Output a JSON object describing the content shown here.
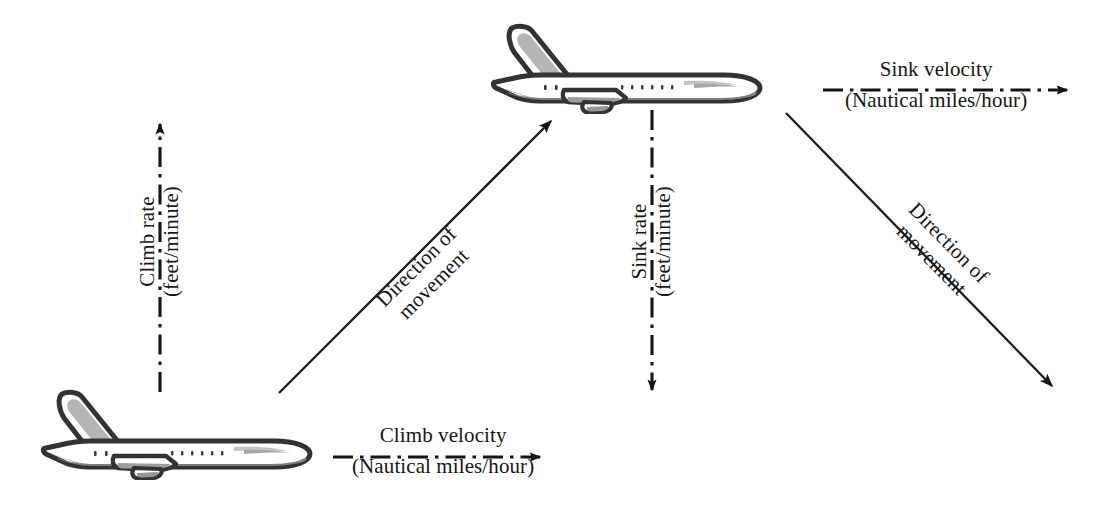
{
  "diagram": {
    "background_color": "#ffffff",
    "line_color": "#1a1a1a",
    "aircraft_fill": "#ffffff",
    "aircraft_shade": "#9a9a9a",
    "aircraft_outline": "#2b2b2b"
  },
  "labels": {
    "climb_rate": {
      "line1": "Climb rate",
      "line2": "(feet/minute)"
    },
    "sink_rate": {
      "line1": "Sink rate",
      "line2": "(feet/minute)"
    },
    "climb_velocity": {
      "line1": "Climb velocity",
      "line2": "(Nautical miles/hour)"
    },
    "sink_velocity": {
      "line1": "Sink velocity",
      "line2": "(Nautical miles/hour)"
    },
    "direction_climb": {
      "line1": "Direction of",
      "line2": "movement"
    },
    "direction_descent": {
      "line1": "Direction of",
      "line2": "movement"
    }
  },
  "arrows": [
    {
      "name": "climb-rate-arrow",
      "style": "dash-dot",
      "orientation": "vertical-up",
      "from": [
        160,
        392
      ],
      "to": [
        160,
        118
      ]
    },
    {
      "name": "sink-rate-arrow",
      "style": "dash-dot",
      "orientation": "vertical-down",
      "from": [
        652,
        110
      ],
      "to": [
        652,
        396
      ]
    },
    {
      "name": "climb-velocity-arrow",
      "style": "dash-dot",
      "orientation": "horizontal-right",
      "from": [
        333,
        457
      ],
      "to": [
        546,
        457
      ]
    },
    {
      "name": "sink-velocity-arrow",
      "style": "dash-dot",
      "orientation": "horizontal-right",
      "from": [
        823,
        90
      ],
      "to": [
        1073,
        90
      ]
    },
    {
      "name": "direction-of-movement-climb-arrow",
      "style": "solid",
      "orientation": "diagonal-up-right",
      "from": [
        279,
        393
      ],
      "to": [
        556,
        116
      ]
    },
    {
      "name": "direction-of-movement-descent-arrow",
      "style": "solid",
      "orientation": "diagonal-down-right",
      "from": [
        786,
        113
      ],
      "to": [
        1057,
        391
      ]
    }
  ],
  "aircraft": [
    {
      "name": "aircraft-lower-left",
      "position": [
        38,
        388
      ],
      "width": 278,
      "height": 92,
      "heading": "right"
    },
    {
      "name": "aircraft-upper-middle",
      "position": [
        488,
        22
      ],
      "width": 278,
      "height": 92,
      "heading": "right"
    }
  ]
}
